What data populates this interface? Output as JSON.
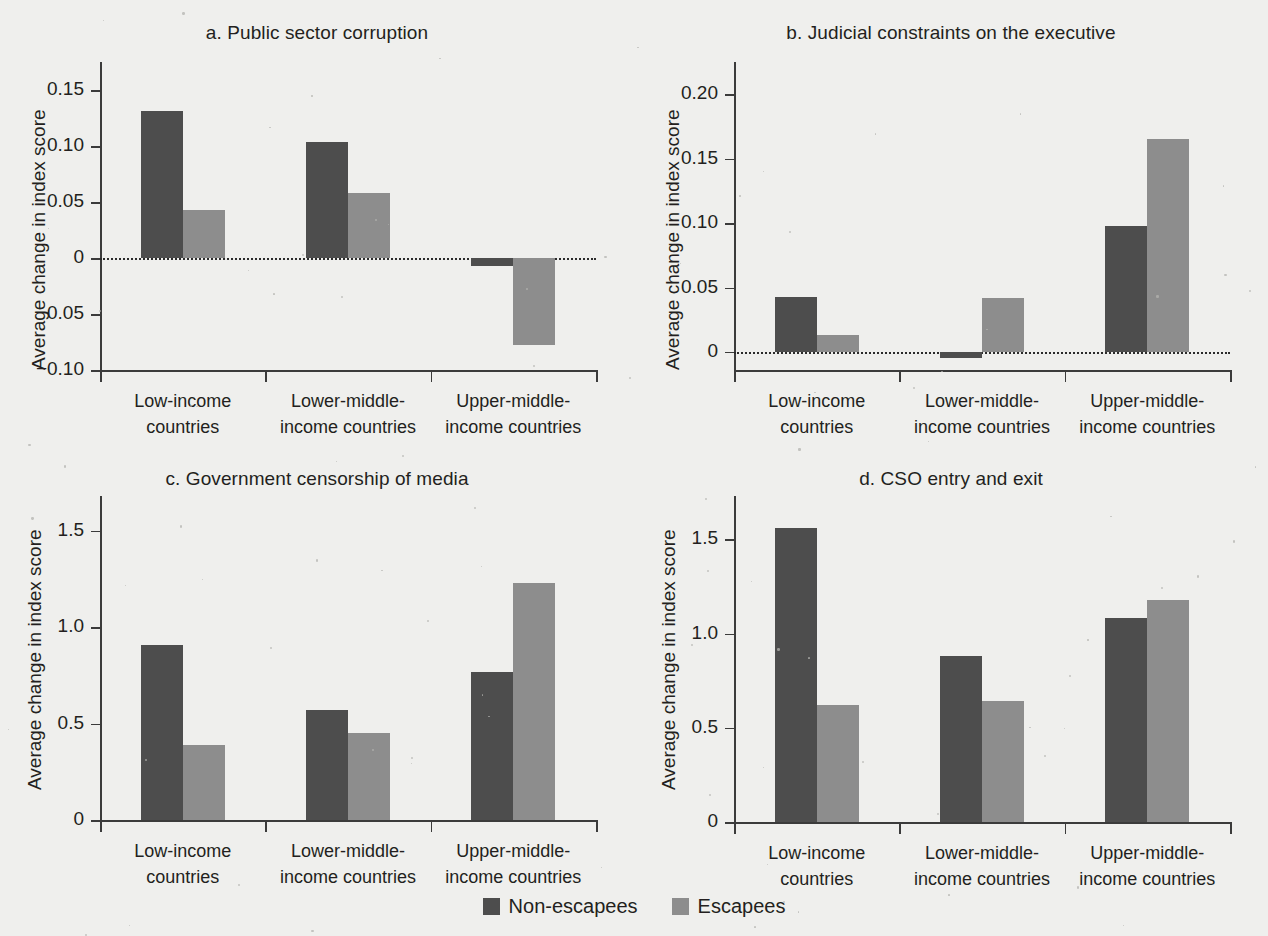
{
  "figure": {
    "background_color": "#efefed",
    "series_colors": {
      "non_escapees": "#4d4d4d",
      "escapees": "#8d8d8d"
    },
    "shared_ylabel": "Average change in index score",
    "categories": [
      "Low-income\ncountries",
      "Lower-middle-\nincome countries",
      "Upper-middle-\nincome countries"
    ],
    "category_lines": [
      [
        "Low-income",
        "countries"
      ],
      [
        "Lower-middle-",
        "income countries"
      ],
      [
        "Upper-middle-",
        "income countries"
      ]
    ],
    "legend": {
      "items": [
        {
          "label": "Non-escapees",
          "color": "#4d4d4d"
        },
        {
          "label": "Escapees",
          "color": "#8d8d8d"
        }
      ]
    }
  },
  "panels": {
    "a": {
      "title": "a. Public sector corruption",
      "ylabel": "Average change in index score",
      "yticks": [
        "0.15",
        "0.10",
        "0.05",
        "0",
        "-0.05",
        "-0.10"
      ]
    },
    "b": {
      "title": "b. Judicial constraints on the executive",
      "ylabel": "Average change in index score",
      "yticks": [
        "0.20",
        "0.15",
        "0.10",
        "0.05",
        "0"
      ]
    },
    "c": {
      "title": "c. Government censorship of media",
      "ylabel": "Average change in index score",
      "yticks": [
        "1.5",
        "1.0",
        "0.5",
        "0"
      ]
    },
    "d": {
      "title": "d. CSO entry and exit",
      "ylabel": "Average change in index score",
      "yticks": [
        "1.5",
        "1.0",
        "0.5",
        "0"
      ]
    }
  },
  "chart_data": [
    {
      "panel": "a",
      "type": "bar",
      "title": "a. Public sector corruption",
      "xlabel": "",
      "ylabel": "Average change in index score",
      "categories": [
        "Low-income countries",
        "Lower-middle-income countries",
        "Upper-middle-income countries"
      ],
      "series": [
        {
          "name": "Non-escapees",
          "color": "#4d4d4d",
          "values": [
            0.131,
            0.104,
            -0.007
          ]
        },
        {
          "name": "Escapees",
          "color": "#8d8d8d",
          "values": [
            0.043,
            0.058,
            -0.078
          ]
        }
      ],
      "ylim": [
        -0.1,
        0.175
      ],
      "yticks": [
        0.15,
        0.1,
        0.05,
        0,
        -0.05,
        -0.1
      ],
      "ytick_labels": [
        "0.15",
        "0.10",
        "0.05",
        "0",
        "-0.05",
        "-0.10"
      ],
      "grid": false,
      "zero_line": true,
      "legend_position": "bottom"
    },
    {
      "panel": "b",
      "type": "bar",
      "title": "b. Judicial constraints on the executive",
      "xlabel": "",
      "ylabel": "Average change in index score",
      "categories": [
        "Low-income countries",
        "Lower-middle-income countries",
        "Upper-middle-income countries"
      ],
      "series": [
        {
          "name": "Non-escapees",
          "color": "#4d4d4d",
          "values": [
            0.043,
            -0.005,
            0.098
          ]
        },
        {
          "name": "Escapees",
          "color": "#8d8d8d",
          "values": [
            0.013,
            0.042,
            0.165
          ]
        }
      ],
      "ylim": [
        -0.014,
        0.225
      ],
      "yticks": [
        0.2,
        0.15,
        0.1,
        0.05,
        0
      ],
      "ytick_labels": [
        "0.20",
        "0.15",
        "0.10",
        "0.05",
        "0"
      ],
      "grid": false,
      "zero_line": true,
      "legend_position": "bottom"
    },
    {
      "panel": "c",
      "type": "bar",
      "title": "c. Government censorship of media",
      "xlabel": "",
      "ylabel": "Average change in index score",
      "categories": [
        "Low-income countries",
        "Lower-middle-income countries",
        "Upper-middle-income countries"
      ],
      "series": [
        {
          "name": "Non-escapees",
          "color": "#4d4d4d",
          "values": [
            0.91,
            0.57,
            0.77
          ]
        },
        {
          "name": "Escapees",
          "color": "#8d8d8d",
          "values": [
            0.39,
            0.45,
            1.23
          ]
        }
      ],
      "ylim": [
        0,
        1.68
      ],
      "yticks": [
        1.5,
        1.0,
        0.5,
        0
      ],
      "ytick_labels": [
        "1.5",
        "1.0",
        "0.5",
        "0"
      ],
      "grid": false,
      "zero_line": false,
      "legend_position": "bottom"
    },
    {
      "panel": "d",
      "type": "bar",
      "title": "d. CSO entry and exit",
      "xlabel": "",
      "ylabel": "Average change in index score",
      "categories": [
        "Low-income countries",
        "Lower-middle-income countries",
        "Upper-middle-income countries"
      ],
      "series": [
        {
          "name": "Non-escapees",
          "color": "#4d4d4d",
          "values": [
            1.56,
            0.88,
            1.08
          ]
        },
        {
          "name": "Escapees",
          "color": "#8d8d8d",
          "values": [
            0.62,
            0.64,
            1.18
          ]
        }
      ],
      "ylim": [
        0,
        1.73
      ],
      "yticks": [
        1.5,
        1.0,
        0.5,
        0
      ],
      "ytick_labels": [
        "1.5",
        "1.0",
        "0.5",
        "0"
      ],
      "grid": false,
      "zero_line": false,
      "legend_position": "bottom"
    }
  ]
}
